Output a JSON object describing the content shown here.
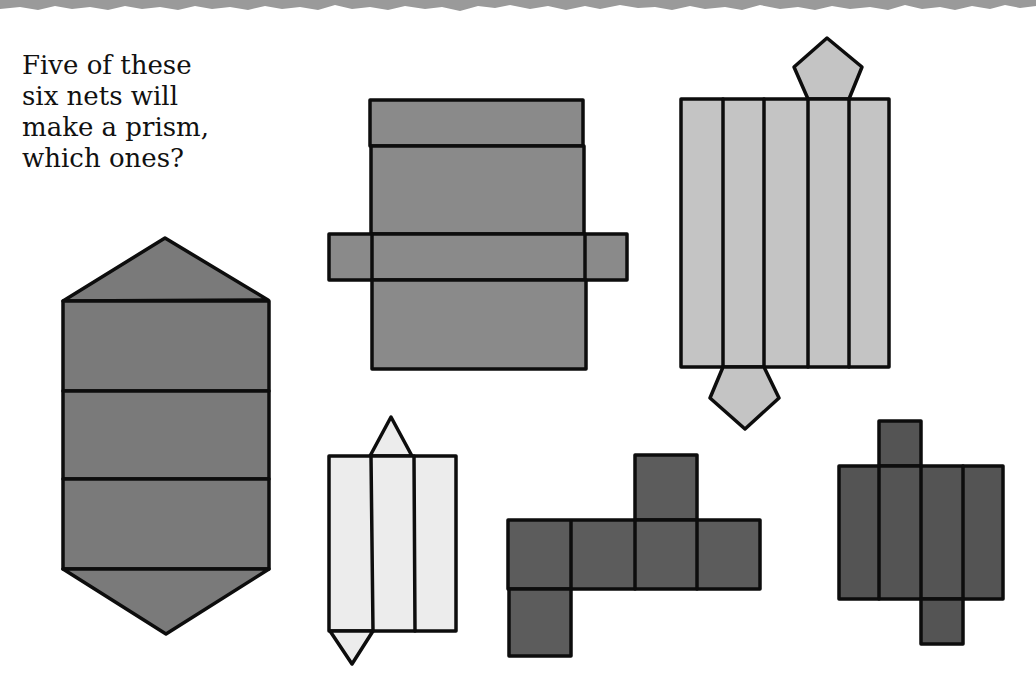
{
  "question": {
    "lines": [
      "Five of these",
      "six nets will",
      "make a prism,",
      "which ones?"
    ]
  },
  "colors": {
    "background": "#ffffff",
    "torn_edge": "#9a9a9a",
    "outline": "#0d0d0d",
    "net_hexagonal_vertical": "#7a7a7a",
    "net_rectangular": "#8a8a8a",
    "net_pentagonal": "#c4c4c4",
    "net_triangular": "#ececec",
    "net_cube": "#5c5c5c",
    "net_square_cuboid": "#545454"
  },
  "nets": [
    {
      "id": "net-triangular-prism-tall",
      "description": "Three stacked rectangles with a triangle on top and bottom",
      "faces": 5
    },
    {
      "id": "net-cuboid-cross",
      "description": "Four stacked rectangles with a small rectangle flap on left and right",
      "faces": 6
    },
    {
      "id": "net-pentagonal-prism",
      "description": "Five vertical rectangles with a pentagon on top and bottom",
      "faces": 7
    },
    {
      "id": "net-triangular-prism-small",
      "description": "Three vertical rectangles with a small triangle on top and bottom",
      "faces": 5
    },
    {
      "id": "net-cube",
      "description": "Row of four squares with one square above and one below",
      "faces": 6
    },
    {
      "id": "net-square-cuboid",
      "description": "Four vertical rectangles with a small square above and below",
      "faces": 6
    }
  ]
}
